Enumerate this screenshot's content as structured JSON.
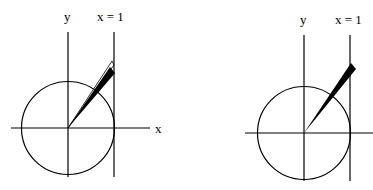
{
  "diagrams": [
    {
      "id": "left",
      "labels": {
        "y_axis": "y",
        "vertical_line": "x = 1",
        "x_axis": "x"
      },
      "description": "Unit circle with angle wedge extending past x = 1 line"
    },
    {
      "id": "right",
      "labels": {
        "y_axis": "y",
        "vertical_line": "x = 1"
      },
      "description": "Unit circle with angle wedge extending past x = 1 line"
    }
  ],
  "colors": {
    "stroke": "#000000",
    "background": "#ffffff"
  }
}
